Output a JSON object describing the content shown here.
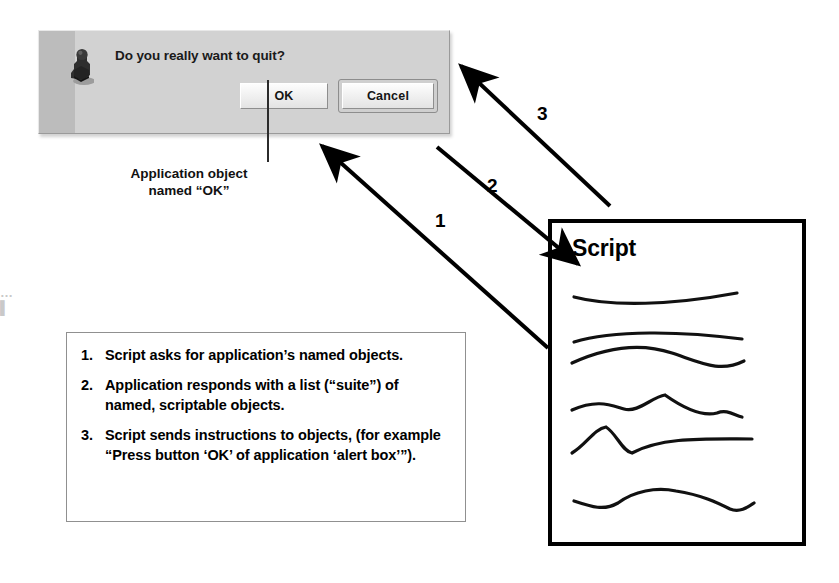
{
  "dialog": {
    "message": "Do you really want to quit?",
    "icon": "alert-figure-icon",
    "buttons": {
      "ok": "OK",
      "cancel": "Cancel"
    }
  },
  "caption": {
    "line1": "Application object",
    "line2": "named “OK”"
  },
  "steps": [
    {
      "num": "1.",
      "text": "Script asks for application’s named objects."
    },
    {
      "num": "2.",
      "text": "Application responds with a list (“suite”) of named, scriptable objects."
    },
    {
      "num": "3.",
      "text": "Script sends instructions to objects, (for example “Press button ‘OK’ of application ‘alert box’”)."
    }
  ],
  "script_doc": {
    "title": "Script",
    "line_count": 6
  },
  "arrows": [
    {
      "label": "1",
      "from": "script-box",
      "to": "dialog-bottom",
      "direction": "up-left"
    },
    {
      "label": "2",
      "from": "dialog-bottom-right",
      "to": "script-box",
      "direction": "down-right"
    },
    {
      "label": "3",
      "from": "script-box-top",
      "to": "dialog-right",
      "direction": "up-left"
    }
  ],
  "edge_marks": {
    "dots": "…",
    "bar": "▌"
  },
  "colors": {
    "dialog_face": "#d2d2d2",
    "dialog_stripe": "#bcbcbc",
    "ink": "#000000",
    "box_border": "#909090"
  }
}
